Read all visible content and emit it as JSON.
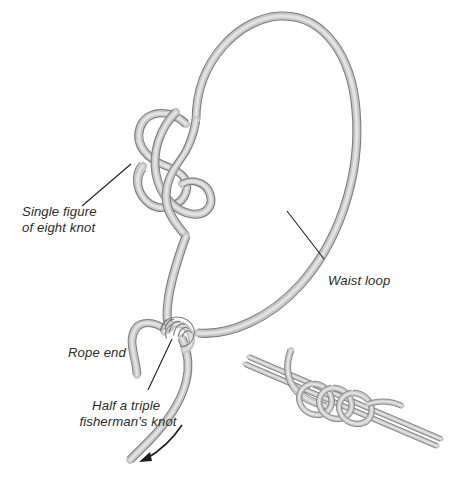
{
  "figure": {
    "background_color": "#ffffff",
    "rope_body_color": "#c6c6c6",
    "rope_outline_color": "#7d7d7d",
    "rope_highlight_color": "#e3e3e3",
    "label_color": "#2b2b2b",
    "leader_color": "#1e1e1e",
    "arrow_color": "#1c1c1c"
  },
  "labels": {
    "figure_eight": {
      "line1": "Single figure",
      "line2": "of eight knot",
      "x": 22,
      "y": 216,
      "align": "start"
    },
    "waist_loop": {
      "line1": "Waist loop",
      "x": 328,
      "y": 285,
      "align": "start"
    },
    "rope_end": {
      "line1": "Rope end",
      "x": 68,
      "y": 357,
      "align": "start"
    },
    "fishermans_knot": {
      "line1": "Half a triple",
      "line2": "fisherman's knot",
      "x": 128,
      "y": 410,
      "align": "middle"
    }
  },
  "annotations": {
    "leader_lines": [
      {
        "name": "figure-eight-leader",
        "x1": 82,
        "y1": 206,
        "x2": 131,
        "y2": 164
      },
      {
        "name": "waist-loop-leader",
        "x1": 324,
        "y1": 259,
        "x2": 287,
        "y2": 211
      },
      {
        "name": "fishermans-knot-leader",
        "x1": 148,
        "y1": 390,
        "x2": 172,
        "y2": 339
      }
    ],
    "direction_arrow": {
      "name": "pull-direction-arrow",
      "description": "curved arrow indicating direction to pull the rope end"
    }
  },
  "parts": {
    "main_loop": "waist loop",
    "upper_knot": "single figure of eight knot",
    "lower_knot": "half a triple fisherman's knot",
    "tail": "rope end"
  },
  "inset": {
    "name": "triple-fishermans-knot-detail",
    "description": "close-up detail of the triple fisherman's knot showing three coils around parallel strands",
    "coil_count": 3
  }
}
